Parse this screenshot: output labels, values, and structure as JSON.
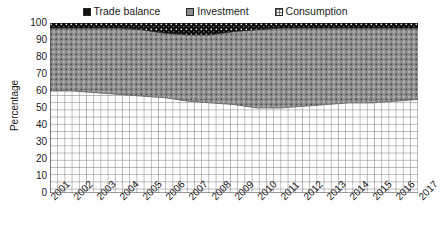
{
  "legend": {
    "position": "top-center",
    "items": [
      {
        "label": "Trade balance",
        "swatch": "trade-balance-swatch",
        "color": "#101010"
      },
      {
        "label": "Investment",
        "swatch": "investment-swatch",
        "color": "#8c8c8c"
      },
      {
        "label": "Consumption",
        "swatch": "consumption-swatch",
        "color": "#ffffff"
      }
    ]
  },
  "axes": {
    "ylabel": "Percentage",
    "xlabel": "",
    "yticks": [
      100,
      90,
      80,
      70,
      60,
      50,
      40,
      30,
      20,
      10,
      0
    ],
    "ylim": [
      0,
      100
    ],
    "grid": true
  },
  "chart_data": {
    "type": "area",
    "stacked": true,
    "title": "",
    "subtitle": "",
    "xlabel": "",
    "ylabel": "Percentage",
    "ylim": [
      0,
      100
    ],
    "grid": true,
    "legend_position": "top-center",
    "categories": [
      "2001",
      "2002",
      "2003",
      "2004",
      "2005",
      "2006",
      "2007",
      "2008",
      "2009",
      "2010",
      "2011",
      "2012",
      "2013",
      "2014",
      "2015",
      "2016",
      "2017"
    ],
    "series": [
      {
        "name": "Consumption",
        "color": "#ffffff",
        "pattern": "grid",
        "values": [
          60,
          60,
          59,
          58,
          57,
          56,
          54,
          53,
          52,
          50,
          50,
          51,
          52,
          53,
          53,
          54,
          55
        ]
      },
      {
        "name": "Investment",
        "color": "#8c8c8c",
        "pattern": "dots",
        "values": [
          37,
          37,
          38,
          39,
          39,
          38,
          39,
          40,
          43,
          46,
          47,
          46,
          45,
          44,
          44,
          43,
          42
        ]
      },
      {
        "name": "Trade balance",
        "color": "#101010",
        "pattern": "dots",
        "values": [
          3,
          3,
          3,
          3,
          4,
          6,
          7,
          7,
          5,
          4,
          3,
          3,
          3,
          3,
          3,
          3,
          3
        ]
      }
    ]
  }
}
